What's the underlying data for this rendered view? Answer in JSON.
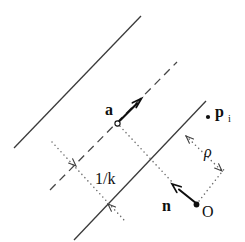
{
  "figure": {
    "background": "#ffffff",
    "colors": {
      "line": "#3a3a3a",
      "dashed_line": "#454545",
      "dotted": "#6e6e6e",
      "dim_arrow": "#3f3f3f",
      "arrow": "#0f0f0f",
      "text": "#0f0f0f",
      "marker_fill": "#0f0f0f"
    },
    "labels": {
      "a": "a",
      "p": "p",
      "p_sub": "i",
      "rho": "ρ",
      "one_over_k": "1/k",
      "n": "n",
      "origin": "O"
    }
  }
}
